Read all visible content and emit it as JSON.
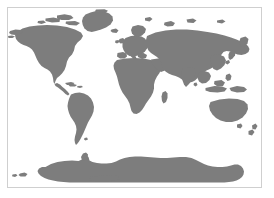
{
  "figure": {
    "kind": "world-map",
    "projection": "equirectangular",
    "title": "",
    "background_color": "#ffffff",
    "land_color": "#7d7d7d",
    "ocean_color": "#ffffff",
    "border_color": "#cfcfcf",
    "highlight_band_color": "#dcdcdc"
  },
  "panels": {
    "main": {
      "name": "world-map-panel",
      "description": "World map excluding Antarctica",
      "lon_range": [
        -180,
        180
      ],
      "lat_range": [
        -60,
        84
      ]
    },
    "antarctica": {
      "name": "antarctica-panel",
      "description": "Antarctica shown as a separate strip",
      "lon_range": [
        -180,
        180
      ],
      "lat_range": [
        -90,
        -60
      ]
    }
  },
  "highlight": {
    "name": "latitude-highlight-band",
    "description": "Light gray horizontal band across southern latitudes",
    "lat_range": [
      -38,
      -60
    ]
  },
  "landmasses": [
    {
      "name": "north-america"
    },
    {
      "name": "greenland"
    },
    {
      "name": "south-america"
    },
    {
      "name": "europe"
    },
    {
      "name": "africa"
    },
    {
      "name": "asia"
    },
    {
      "name": "australia"
    },
    {
      "name": "new-zealand"
    },
    {
      "name": "japan"
    },
    {
      "name": "madagascar"
    },
    {
      "name": "indonesia"
    },
    {
      "name": "british-isles"
    },
    {
      "name": "antarctica"
    }
  ]
}
